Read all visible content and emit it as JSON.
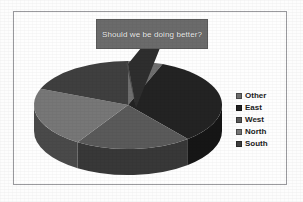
{
  "chart_data": {
    "type": "pie",
    "title": "",
    "subtitle": "",
    "xlabel": "",
    "ylabel": "",
    "three_d": true,
    "legend_position": "right",
    "grid": false,
    "annotation": "Should we be doing better?",
    "categories": [
      "Other",
      "East",
      "West",
      "North",
      "South"
    ],
    "values": [
      6,
      33,
      20,
      22,
      19
    ],
    "slices": [
      {
        "label": "Other",
        "value": 6,
        "percent": 6,
        "color": "#6f6f6f",
        "start_deg": 0,
        "end_deg": 22
      },
      {
        "label": "East",
        "value": 33,
        "percent": 33,
        "color": "#232323",
        "start_deg": 22,
        "end_deg": 140
      },
      {
        "label": "West",
        "value": 20,
        "percent": 20,
        "color": "#5a5a5a",
        "start_deg": 140,
        "end_deg": 212
      },
      {
        "label": "North",
        "value": 22,
        "percent": 22,
        "color": "#777777",
        "start_deg": 212,
        "end_deg": 291
      },
      {
        "label": "South",
        "value": 19,
        "percent": 19,
        "color": "#3f3f3f",
        "start_deg": 291,
        "end_deg": 360
      }
    ]
  },
  "callout": {
    "text": "Should we be doing better?",
    "fill_color": "#6b6b6b",
    "text_color": "#f2f2f2"
  },
  "legend": {
    "items": [
      {
        "label": "Other",
        "color": "#6f6f6f"
      },
      {
        "label": "East",
        "color": "#232323"
      },
      {
        "label": "West",
        "color": "#5a5a5a"
      },
      {
        "label": "North",
        "color": "#777777"
      },
      {
        "label": "South",
        "color": "#3f3f3f"
      }
    ]
  },
  "frame": {
    "border_color": "#9a9a9e",
    "background_color": "#fefefe"
  }
}
